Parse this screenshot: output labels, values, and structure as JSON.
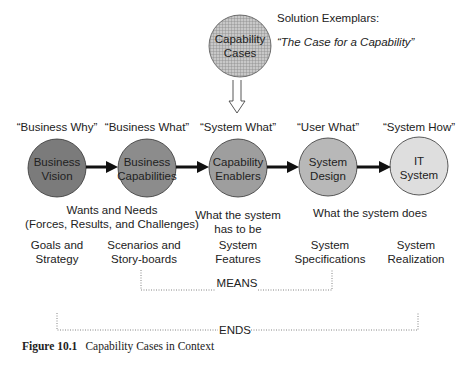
{
  "top": {
    "circle_label": [
      "Capability",
      "Cases"
    ],
    "exemplar_title": "Solution Exemplars:",
    "exemplar_quote": "“The Case for a Capability”"
  },
  "stages": [
    {
      "quote": "“Business Why”",
      "circle": [
        "Business",
        "Vision"
      ],
      "fill": "#7b7b7b",
      "bottom": [
        "Goals and",
        "Strategy"
      ]
    },
    {
      "quote": "“Business What”",
      "circle": [
        "Business",
        "Capabilities"
      ],
      "fill": "#8c8c8c",
      "bottom": [
        "Scenarios and",
        "Story-boards"
      ]
    },
    {
      "quote": "“System What”",
      "circle": [
        "Capability",
        "Enablers"
      ],
      "fill": "#9e9e9e",
      "bottom": [
        "System",
        "Features"
      ]
    },
    {
      "quote": "“User What”",
      "circle": [
        "System",
        "Design"
      ],
      "fill": "#b8b8b8",
      "bottom": [
        "System",
        "Specifications"
      ]
    },
    {
      "quote": "“System How”",
      "circle": [
        "IT",
        "System"
      ],
      "fill": "#dedede",
      "bottom": [
        "System",
        "Realization"
      ]
    }
  ],
  "middle": {
    "wants": [
      "Wants and Needs",
      "(Forces, Results, and Challenges)"
    ],
    "has_to_be": [
      "What the system",
      "has to be"
    ],
    "does": "What the system does"
  },
  "brackets": {
    "means": "MEANS",
    "ends": "ENDS"
  },
  "caption": {
    "number": "Figure 10.1",
    "text": "Capability Cases in Context"
  }
}
